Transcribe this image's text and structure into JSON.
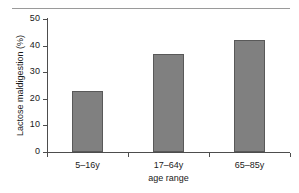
{
  "chart_data": {
    "type": "bar",
    "title": "",
    "categories": [
      "5–16y",
      "17–64y",
      "65–85y"
    ],
    "values": [
      23,
      37,
      42
    ],
    "xlabel": "age range",
    "ylabel": "Lactose maldigestion (%)",
    "ylim": [
      0,
      50
    ],
    "yticks": [
      0,
      10,
      20,
      30,
      40,
      50
    ],
    "ytick_labels": [
      "0",
      "10",
      "20",
      "30",
      "40",
      "50"
    ],
    "grid": false,
    "legend": false,
    "bar_color": "#808080",
    "bar_edge_color": "#595959",
    "axis_color": "#4d4d4d",
    "rule_color": "#9a9a9a",
    "background": "#ffffff"
  },
  "axes": {
    "y_title": "Lactose maldigestion (%)",
    "x_title": "age range"
  },
  "ticks": {
    "y": [
      {
        "label": "50",
        "value": 50
      },
      {
        "label": "40",
        "value": 40
      },
      {
        "label": "30",
        "value": 30
      },
      {
        "label": "20",
        "value": 20
      },
      {
        "label": "10",
        "value": 10
      },
      {
        "label": "0",
        "value": 0
      }
    ]
  },
  "bars": [
    {
      "category": "5–16y",
      "value": 23
    },
    {
      "category": "17–64y",
      "value": 37
    },
    {
      "category": "65–85y",
      "value": 42
    }
  ]
}
